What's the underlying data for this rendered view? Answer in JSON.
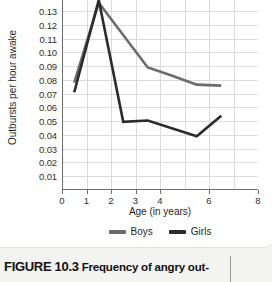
{
  "figure": {
    "caption_number": "FIGURE 10.3",
    "caption_text": "Frequency of angry out-"
  },
  "chart_data": {
    "type": "line",
    "title": "",
    "xlabel": "Age (in years)",
    "ylabel": "Outbursts per hour awake",
    "xlim": [
      0,
      8
    ],
    "ylim": [
      0,
      0.138
    ],
    "grid": true,
    "legend_position": "bottom",
    "x_ticks": [
      0,
      1,
      2,
      3,
      4,
      6,
      8
    ],
    "x_tick_labels": [
      "0",
      "1",
      "2",
      "3",
      "4",
      "6",
      "8"
    ],
    "y_ticks": [
      0.01,
      0.02,
      0.03,
      0.04,
      0.05,
      0.06,
      0.07,
      0.08,
      0.09,
      0.1,
      0.11,
      0.12,
      0.13
    ],
    "y_tick_labels": [
      "0.01",
      "0.02",
      "0.03",
      "0.04",
      "0.05",
      "0.06",
      "0.07",
      "0.08",
      "0.09",
      "0.10",
      "0.11",
      "0.12",
      "0.13"
    ],
    "series": [
      {
        "name": "Boys",
        "color": "#6b6b6b",
        "x": [
          0.5,
          1.5,
          3.5,
          4.5,
          5.5,
          6.5
        ],
        "y": [
          0.078,
          0.136,
          0.089,
          0.083,
          0.0765,
          0.0758
        ]
      },
      {
        "name": "Girls",
        "color": "#2b2b2b",
        "x": [
          0.5,
          1.5,
          2.5,
          3.5,
          5.5,
          6.5
        ],
        "y": [
          0.071,
          0.138,
          0.0495,
          0.0505,
          0.039,
          0.054
        ]
      }
    ]
  },
  "legend": {
    "items": [
      {
        "label": "Boys",
        "color": "#6b6b6b"
      },
      {
        "label": "Girls",
        "color": "#2b2b2b"
      }
    ]
  }
}
